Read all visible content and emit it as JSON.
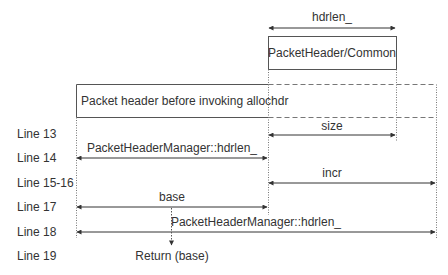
{
  "diagram": {
    "boxes": {
      "top_box": "PacketHeader/Common",
      "before_box": "Packet header before invoking allochdr"
    },
    "arrows": {
      "hdrlen_top": "hdrlen_",
      "size": "size",
      "line14": "PacketHeaderManager::hdrlen_",
      "incr": "incr",
      "base": "base",
      "line18": "PacketHeaderManager::hdrlen_"
    },
    "return_label": "Return (base)",
    "line_labels": [
      "Line 13",
      "Line 14",
      "Line 15-16",
      "Line 17",
      "Line 18",
      "Line 19"
    ]
  }
}
